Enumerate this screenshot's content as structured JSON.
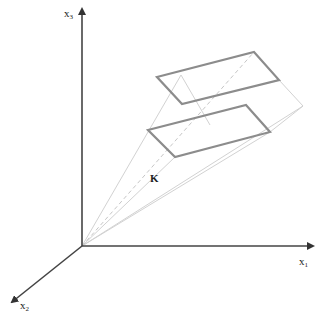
{
  "diagram": {
    "axes": {
      "x1": {
        "label": "x",
        "subscript": "1"
      },
      "x2": {
        "label": "x",
        "subscript": "2"
      },
      "x3": {
        "label": "x",
        "subscript": "3"
      }
    },
    "cone_label": "K",
    "colors": {
      "axis": "#444444",
      "rectangle": "#8c8c8c",
      "projection": "#d0d0d0",
      "dashed": "#c8c8c8"
    },
    "origin": [
      82,
      246
    ],
    "upper_rectangle": [
      [
        157,
        77
      ],
      [
        254,
        52
      ],
      [
        279,
        80
      ],
      [
        182,
        104
      ]
    ],
    "lower_rectangle": [
      [
        148,
        130
      ],
      [
        246,
        105
      ],
      [
        270,
        132
      ],
      [
        175,
        157
      ]
    ]
  }
}
